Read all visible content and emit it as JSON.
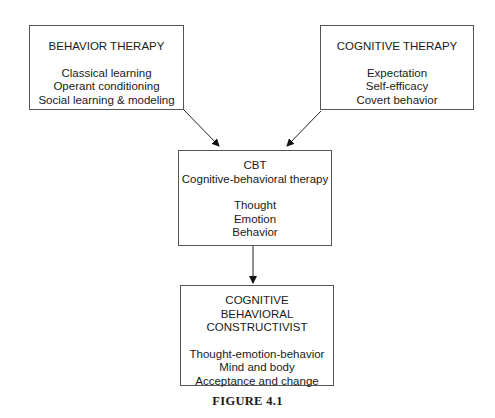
{
  "diagram": {
    "boxes": {
      "behavior_therapy": {
        "title": "BEHAVIOR THERAPY",
        "items": [
          "Classical learning",
          "Operant conditioning",
          "Social learning & modeling"
        ]
      },
      "cognitive_therapy": {
        "title": "COGNITIVE THERAPY",
        "items": [
          "Expectation",
          "Self-efficacy",
          "Covert behavior"
        ]
      },
      "cbt": {
        "title": "CBT",
        "subtitle": "Cognitive-behavioral therapy",
        "items": [
          "Thought",
          "Emotion",
          "Behavior"
        ]
      },
      "cbc": {
        "title_lines": [
          "COGNITIVE",
          "BEHAVIORAL",
          "CONSTRUCTIVIST"
        ],
        "items": [
          "Thought-emotion-behavior",
          "Mind and body",
          "Acceptance and change"
        ]
      }
    },
    "edges": [
      {
        "from": "behavior_therapy",
        "to": "cbt"
      },
      {
        "from": "cognitive_therapy",
        "to": "cbt"
      },
      {
        "from": "cbt",
        "to": "cbc"
      }
    ],
    "caption": "FIGURE 4.1"
  }
}
